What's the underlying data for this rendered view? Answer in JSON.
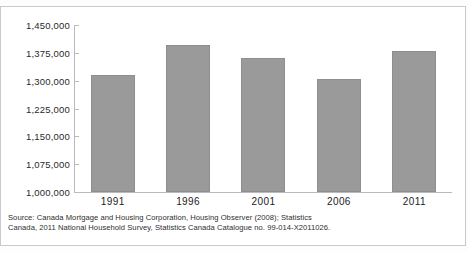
{
  "figure": {
    "top_clipped_text": "",
    "bar_color": "#9a9a9a",
    "axis_color": "#b9b9c0",
    "frame_color": "#c9c9cf",
    "background": "#ffffff"
  },
  "chart_data": {
    "type": "bar",
    "title": "",
    "subtitle": "",
    "xlabel": "",
    "ylabel": "",
    "categories": [
      "1991",
      "1996",
      "2001",
      "2006",
      "2011"
    ],
    "values": [
      1315000,
      1395000,
      1360000,
      1305000,
      1380000
    ],
    "series": [
      {
        "name": "Households",
        "values": [
          1315000,
          1395000,
          1360000,
          1305000,
          1380000
        ]
      }
    ],
    "ylim": [
      1000000,
      1450000
    ],
    "ytick_values": [
      1450000,
      1375000,
      1300000,
      1225000,
      1150000,
      1075000,
      1000000
    ],
    "ytick_labels": [
      "1,450,000",
      "1,375,000",
      "1,300,000",
      "1,225,000",
      "1,150,000",
      "1,075,000",
      "1,000,000"
    ],
    "ytick_step": 75000,
    "grid": false,
    "legend": "none",
    "legend_position": "none",
    "annotations": []
  },
  "source": {
    "line1": "Source: Canada Mortgage and Housing Corporation, Housing Observer (2008); Statistics",
    "line2": "Canada, 2011 National Household Survey, Statistics Canada Catalogue no. 99-014-X2011026."
  }
}
